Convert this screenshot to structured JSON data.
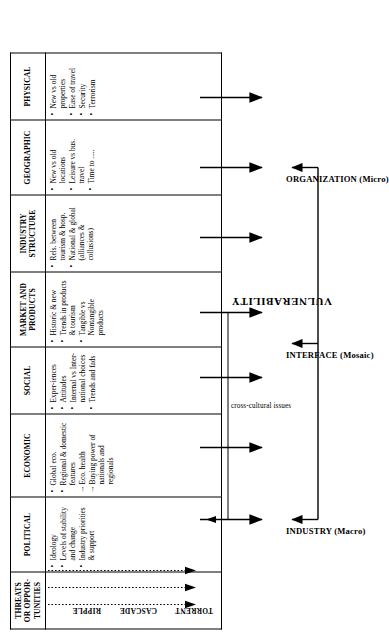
{
  "diagram": {
    "table": {
      "headers": [
        "THREATS\nOR OPPOR-\nTUNITIES",
        "POLITICAL",
        "ECONOMIC",
        "SOCIAL",
        "MARKET AND\nPRODUCTS",
        "INDUSTRY\nSTRUCTURE",
        "GEOGRAPHIC",
        "PHYSICAL"
      ],
      "header_lines": {
        "threats": [
          "THREATS",
          "OR OPPOR-",
          "TUNITIES"
        ],
        "political": [
          "POLITICAL"
        ],
        "economic": [
          "ECONOMIC"
        ],
        "social": [
          "SOCIAL"
        ],
        "market": [
          "MARKET  AND",
          "PRODUCTS"
        ],
        "industry": [
          "INDUSTRY",
          "STRUCTURE"
        ],
        "geographic": [
          "GEOGRAPHIC"
        ],
        "physical": [
          "PHYSICAL"
        ]
      },
      "impact_levels": [
        "RIPPLE",
        "CASCADE",
        "TORRENT"
      ],
      "columns": {
        "political": [
          {
            "marker": "bullet",
            "text": "Ideology"
          },
          {
            "marker": "bullet",
            "text": "Levels of stability and change"
          },
          {
            "marker": "bullet",
            "text": "Industry priorities & support"
          }
        ],
        "economic": [
          {
            "marker": "bullet",
            "text": "Global eco."
          },
          {
            "marker": "bullet",
            "text": "Regional & domestic features"
          },
          {
            "marker": "arrow",
            "text": "Eco. health"
          },
          {
            "marker": "arrow",
            "text": "Buying power of nationals and regionals"
          }
        ],
        "social": [
          {
            "marker": "bullet",
            "text": "Exper-iences"
          },
          {
            "marker": "bullet",
            "text": "Attitudes"
          },
          {
            "marker": "bullet",
            "text": "Internal vs Inter-national choices"
          },
          {
            "marker": "bullet",
            "text": "Trends and fads"
          }
        ],
        "market": [
          {
            "marker": "bullet",
            "text": "Historic & new"
          },
          {
            "marker": "bullet",
            "text": "Trends in products & tourism"
          },
          {
            "marker": "bullet",
            "text": "Tangible vs Nontangible products"
          }
        ],
        "industry": [
          {
            "marker": "bullet",
            "text": "Rels. between tourism & hosp."
          },
          {
            "marker": "bullet",
            "text": "National & global (alliances & collusions)"
          }
        ],
        "geographic": [
          {
            "marker": "bullet",
            "text": "New vs old locations"
          },
          {
            "marker": "bullet",
            "text": "Leisure vs bus. travel"
          },
          {
            "marker": "bullet",
            "text": "Time to ....."
          }
        ],
        "physical": [
          {
            "marker": "bullet",
            "text": "New vs old properties"
          },
          {
            "marker": "bullet",
            "text": "Ease of travel"
          },
          {
            "marker": "bullet",
            "text": "Security"
          },
          {
            "marker": "bullet",
            "text": "Terrorism"
          }
        ]
      }
    },
    "connector_label": "cross-cultural issues",
    "tiers": [
      {
        "label": "INDUSTRY (Macro)"
      },
      {
        "label": "INTERFACE (Mosaic)"
      },
      {
        "label": "ORGANIZATION (Micro)"
      }
    ],
    "outcome_label": "VULNERABILITY",
    "colors": {
      "line": "#000000",
      "background": "#ffffff",
      "text": "#000000"
    }
  }
}
